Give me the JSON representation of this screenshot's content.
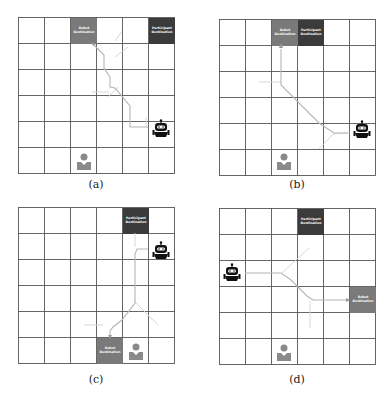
{
  "figure": {
    "grid_size": 6,
    "colors": {
      "grid_line": "#555555",
      "robot_destination": "#7a7a7a",
      "participant_destination": "#3b3b3b",
      "person": "#8a8a8a",
      "robot": "#111111",
      "path": "#b5b5b5",
      "path_ghost": "#d4d4d4"
    },
    "panels": [
      {
        "caption": "(a)",
        "robot_destination": {
          "label": "Robot Destination",
          "col": 2,
          "row": 0
        },
        "participant_destination": {
          "label": "Participant Destination",
          "col": 5,
          "row": 0
        },
        "robot": {
          "col": 5,
          "row": 4
        },
        "participant": {
          "col": 2,
          "row": 5
        }
      },
      {
        "caption": "(b)",
        "robot_destination": {
          "label": "Robot Destination",
          "col": 2,
          "row": 0
        },
        "participant_destination": {
          "label": "Participant Destination",
          "col": 3,
          "row": 0
        },
        "robot": {
          "col": 5,
          "row": 4
        },
        "participant": {
          "col": 2,
          "row": 5
        }
      },
      {
        "caption": "(c)",
        "robot_destination": {
          "label": "Robot Destination",
          "col": 3,
          "row": 5
        },
        "participant_destination": {
          "label": "Participant Destination",
          "col": 4,
          "row": 0
        },
        "robot": {
          "col": 5,
          "row": 1
        },
        "participant": {
          "col": 4,
          "row": 5
        }
      },
      {
        "caption": "(d)",
        "robot_destination": {
          "label": "Robot Destination",
          "col": 5,
          "row": 3
        },
        "participant_destination": {
          "label": "Participant Destination",
          "col": 3,
          "row": 0
        },
        "robot": {
          "col": 0,
          "row": 2
        },
        "participant": {
          "col": 2,
          "row": 5
        }
      }
    ]
  }
}
